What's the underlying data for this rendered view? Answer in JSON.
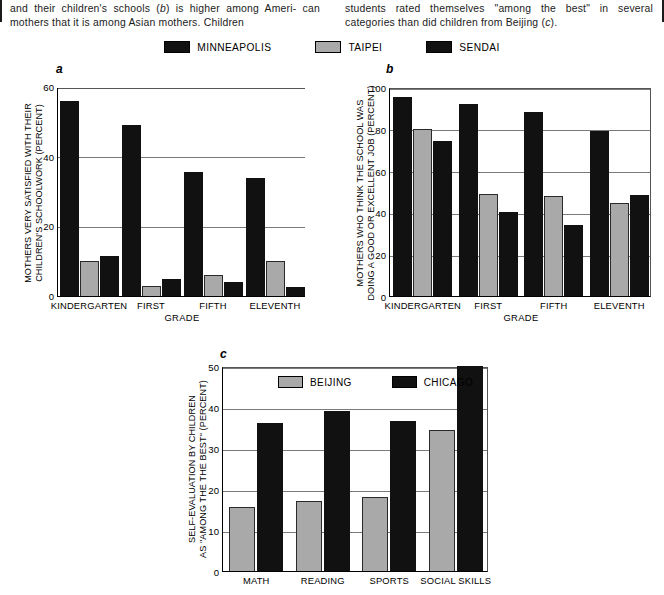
{
  "caption": {
    "clipped_line": "satisfaction with academic performance of children (a)",
    "left_lines": [
      "and their children's schools (b) is higher among Ameri-",
      "can mothers that it is among Asian mothers. Children"
    ],
    "right_lines": [
      "students rated themselves \"among the best\" in several",
      "categories than did children from Beijing (c)."
    ],
    "italic_markers": [
      "a",
      "b",
      "c"
    ]
  },
  "legend": {
    "entries": [
      {
        "label": "MINNEAPOLIS",
        "color": "#111111",
        "style": "dark"
      },
      {
        "label": "TAIPEI",
        "color": "#a9a9a9",
        "style": "light"
      },
      {
        "label": "SENDAI",
        "color": "#111111",
        "style": "dark"
      }
    ]
  },
  "colors": {
    "dark": "#111111",
    "light": "#a9a9a9",
    "gridline": "#7a7a7a",
    "axis": "#000000",
    "background": "#ffffff"
  },
  "chart_data": [
    {
      "id": "a",
      "panel_letter": "a",
      "type": "bar",
      "title": "",
      "xlabel": "GRADE",
      "ylabel": "MOTHERS VERY SATISFIED WITH THEIR CHILDREN'S SCHOOLWORK (PERCENT)",
      "ylabel_lines": [
        "MOTHERS VERY SATISFIED WITH THEIR",
        "CHILDREN'S SCHOOLWORK (PERCENT)"
      ],
      "categories": [
        "KINDERGARTEN",
        "FIRST",
        "FIFTH",
        "ELEVENTH"
      ],
      "series": [
        {
          "name": "MINNEAPOLIS",
          "style": "dark",
          "values": [
            56,
            49,
            35.5,
            34
          ]
        },
        {
          "name": "TAIPEI",
          "style": "light",
          "values": [
            10,
            3,
            6,
            10
          ]
        },
        {
          "name": "SENDAI",
          "style": "dark",
          "values": [
            11.5,
            5,
            4,
            2.5
          ]
        }
      ],
      "ylim": [
        0,
        60
      ],
      "yticks": [
        0,
        20,
        40,
        60
      ],
      "grid": true,
      "framed": false,
      "legend_position": "top-shared"
    },
    {
      "id": "b",
      "panel_letter": "b",
      "type": "bar",
      "title": "",
      "xlabel": "GRADE",
      "ylabel": "MOTHERS WHO THINK THE SCHOOL WAS DOING A GOOD OR EXCELLENT JOB (PERCENT)",
      "ylabel_lines": [
        "MOTHERS WHO THINK THE SCHOOL WAS",
        "DOING A GOOD OR EXCELLENT JOB (PERCENT)"
      ],
      "categories": [
        "KINDERGARTEN",
        "FIRST",
        "FIFTH",
        "ELEVENTH"
      ],
      "series": [
        {
          "name": "MINNEAPOLIS",
          "style": "dark",
          "values": [
            95,
            92,
            88,
            79
          ]
        },
        {
          "name": "TAIPEI",
          "style": "light",
          "values": [
            80,
            49,
            48,
            44.5
          ]
        },
        {
          "name": "SENDAI",
          "style": "dark",
          "values": [
            74,
            40,
            34,
            48.5
          ]
        }
      ],
      "ylim": [
        0,
        100
      ],
      "yticks": [
        0,
        20,
        40,
        60,
        80,
        100
      ],
      "grid": true,
      "framed": true,
      "legend_position": "top-shared"
    },
    {
      "id": "c",
      "panel_letter": "c",
      "type": "bar",
      "title": "",
      "xlabel": "",
      "ylabel": "SELF-EVALUATION BY CHILDREN AS \"AMONG THE THE BEST\" (PERCENT)",
      "ylabel_lines": [
        "SELF-EVALUATION BY CHILDREN",
        "AS \"AMONG THE THE BEST\" (PERCENT)"
      ],
      "categories": [
        "MATH",
        "READING",
        "SPORTS",
        "SOCIAL SKILLS"
      ],
      "series": [
        {
          "name": "BEIJING",
          "style": "light",
          "values": [
            15.5,
            17,
            18,
            34.5
          ]
        },
        {
          "name": "CHICAGO",
          "style": "dark",
          "values": [
            36,
            39,
            36.5,
            50
          ]
        }
      ],
      "ylim": [
        0,
        50
      ],
      "yticks": [
        0,
        10,
        20,
        30,
        40,
        50
      ],
      "grid": true,
      "framed": true,
      "legend_position": "inside-top-left",
      "inline_legend": [
        {
          "label": "BEIJING",
          "color": "#a9a9a9",
          "style": "light"
        },
        {
          "label": "CHICAGO",
          "color": "#111111",
          "style": "dark"
        }
      ]
    }
  ]
}
